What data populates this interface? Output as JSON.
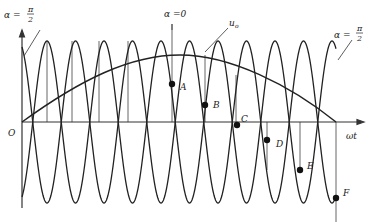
{
  "diagram": {
    "colors": {
      "stroke": "#222222",
      "background": "#ffffff",
      "axis": "#555555"
    },
    "axes": {
      "origin_label": "O",
      "x_label": "ωt"
    },
    "annotations": {
      "alpha_left": {
        "lhs": "α =",
        "num": "π",
        "den": "2"
      },
      "alpha_center": "α =0",
      "alpha_right": {
        "lhs": "α =",
        "num": "π",
        "den": "2"
      },
      "envelope_label": "u",
      "envelope_sub": "o"
    },
    "points": [
      {
        "label": "A"
      },
      {
        "label": "B"
      },
      {
        "label": "C"
      },
      {
        "label": "D"
      },
      {
        "label": "E"
      },
      {
        "label": "F"
      }
    ]
  }
}
